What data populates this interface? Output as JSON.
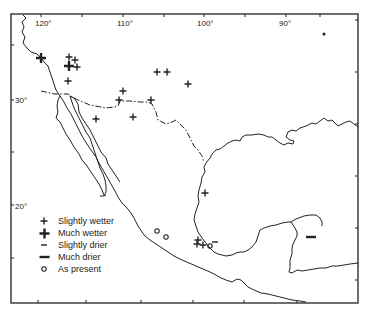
{
  "map": {
    "region": "Mexico and southwestern United States",
    "longitude_labels": [
      "120°",
      "110°",
      "100°",
      "90°"
    ],
    "latitude_labels": [
      "30°",
      "20°"
    ],
    "colors": {
      "ink": "#222222",
      "background": "#ffffff"
    }
  },
  "legend": {
    "items": [
      {
        "symbol": "small-plus",
        "label": "Slightly wetter"
      },
      {
        "symbol": "large-plus",
        "label": "Much wetter"
      },
      {
        "symbol": "small-dash",
        "label": "Slightly drier"
      },
      {
        "symbol": "large-dash",
        "label": "Much drier"
      },
      {
        "symbol": "circle",
        "label": "As present"
      }
    ]
  },
  "sites": {
    "slightly_wetter": [
      [
        69,
        57
      ],
      [
        75,
        60
      ],
      [
        77,
        67
      ],
      [
        68,
        81
      ],
      [
        157,
        72
      ],
      [
        167,
        72
      ],
      [
        123,
        91
      ],
      [
        119,
        100
      ],
      [
        151,
        100
      ],
      [
        96,
        119
      ],
      [
        133,
        117
      ],
      [
        188,
        84
      ],
      [
        205,
        193
      ],
      [
        198,
        240
      ],
      [
        197,
        244
      ],
      [
        203,
        245
      ]
    ],
    "much_wetter": [
      [
        41,
        58
      ],
      [
        69,
        66
      ]
    ],
    "slightly_drier": [
      [
        215,
        242
      ]
    ],
    "much_drier": [
      [
        311,
        237
      ]
    ],
    "as_present": [
      [
        157,
        231
      ],
      [
        166,
        237
      ],
      [
        210,
        246
      ]
    ],
    "dot": [
      [
        324,
        34
      ]
    ]
  }
}
